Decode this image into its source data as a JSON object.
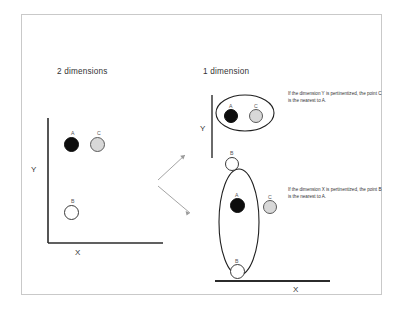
{
  "figure": {
    "panels": {
      "left": {
        "title": "2 dimensions",
        "x_axis_label": "X",
        "y_axis_label": "Y",
        "points": [
          {
            "label": "A",
            "fill": "black"
          },
          {
            "label": "C",
            "fill": "gray"
          },
          {
            "label": "B",
            "fill": "white"
          }
        ]
      },
      "right": {
        "title": "1 dimension",
        "x_axis_label": "X",
        "y_axis_label": "Y",
        "group_y": {
          "points": [
            {
              "label": "A",
              "fill": "black"
            },
            {
              "label": "C",
              "fill": "gray"
            }
          ],
          "outside_point": {
            "label": "B",
            "fill": "white"
          }
        },
        "group_x": {
          "points": [
            {
              "label": "A",
              "fill": "black"
            },
            {
              "label": "B",
              "fill": "white"
            }
          ],
          "outside_point": {
            "label": "C",
            "fill": "gray"
          }
        }
      }
    },
    "annotations": {
      "y_note": "If the dimension Y is pertinentized, the point C is the nearest to A.",
      "x_note": "If the dimension X is pertinentized, the point B is the nearest to A."
    },
    "colors": {
      "point_black": "#0d0d0d",
      "point_gray": "#d8d8d8",
      "point_white": "#ffffff",
      "axis": "#2b2b2b",
      "arrow": "#9a9a9a",
      "frame": "#c9c9c9"
    }
  }
}
